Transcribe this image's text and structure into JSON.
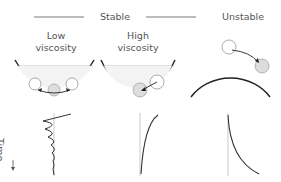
{
  "labels": {
    "stable": "Stable",
    "unstable": "Unstable",
    "low_viscosity": "Low\nviscosity",
    "low_line1": "Low",
    "low_line2": "viscosity",
    "high_line1": "High",
    "high_line2": "viscosity",
    "time_axis": "Time"
  },
  "panels": [
    {
      "name": "stable-low-viscosity",
      "shape": "bowl",
      "motion": "oscillation",
      "trace": "damped-wave"
    },
    {
      "name": "stable-high-viscosity",
      "shape": "bowl",
      "motion": "slow-return",
      "trace": "monotonic-approach"
    },
    {
      "name": "unstable",
      "shape": "dome",
      "motion": "roll-away",
      "trace": "divergence"
    }
  ],
  "colors": {
    "stroke": "#333333",
    "thin_stroke": "#888888",
    "ball_fill": "#dddddd",
    "ball_outline": "#999999",
    "fluid_line": "#aaaaaa",
    "text": "#555555"
  }
}
